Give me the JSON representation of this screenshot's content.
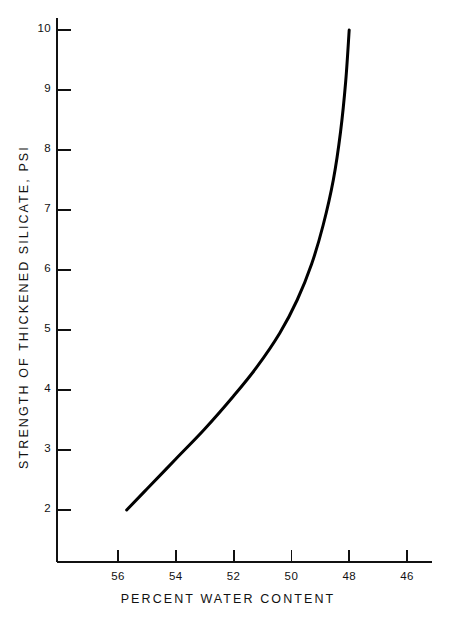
{
  "chart_data": {
    "type": "line",
    "title": "",
    "xlabel": "PERCENT WATER CONTENT",
    "ylabel": "STRENGTH OF THICKENED SILICATE, PSI",
    "xlim": [
      57.0,
      45.0
    ],
    "ylim": [
      1.1,
      10.4
    ],
    "x_tick_labels": [
      "56",
      "54",
      "52",
      "50",
      "48",
      "46"
    ],
    "x_ticks": [
      56,
      54,
      52,
      50,
      48,
      46
    ],
    "y_tick_labels": [
      "2",
      "3",
      "4",
      "5",
      "6",
      "7",
      "8",
      "9",
      "10"
    ],
    "y_ticks": [
      2,
      3,
      4,
      5,
      6,
      7,
      8,
      9,
      10
    ],
    "x_axis_direction": "decreasing",
    "grid": false,
    "legend": null,
    "series": [
      {
        "name": "Strength of thickened silicate vs percent water content",
        "color": "#000000",
        "line_width": 3,
        "x": [
          55.7,
          55.0,
          54.0,
          53.0,
          52.0,
          51.2,
          50.4,
          49.8,
          49.3,
          48.9,
          48.55,
          48.3,
          48.12,
          48.0
        ],
        "y": [
          2.0,
          2.35,
          2.85,
          3.35,
          3.9,
          4.38,
          4.95,
          5.5,
          6.1,
          6.75,
          7.5,
          8.3,
          9.15,
          10.0
        ]
      }
    ]
  },
  "axes": {
    "y_axis_name": "y-axis",
    "x_axis_name": "x-axis"
  }
}
